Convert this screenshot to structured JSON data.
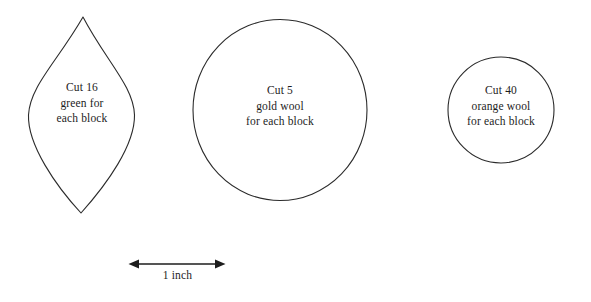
{
  "page": {
    "background_color": "#ffffff",
    "ink_color": "#1d1d1d",
    "stroke_color": "#2b2b2b"
  },
  "shapes": [
    {
      "name": "leaf",
      "icon": "leaf-outline-shape",
      "lines": [
        "Cut 16",
        "green for",
        "each block"
      ],
      "quantity": "16",
      "material": "green"
    },
    {
      "name": "large-circle",
      "icon": "circle-outline-shape",
      "lines": [
        "Cut 5",
        "gold wool",
        "for each block"
      ],
      "quantity": "5",
      "material": "gold wool"
    },
    {
      "name": "small-circle",
      "icon": "circle-outline-shape",
      "lines": [
        "Cut 40",
        "orange wool",
        "for each block"
      ],
      "quantity": "40",
      "material": "orange wool"
    }
  ],
  "scale_bar": {
    "label": "1 inch",
    "icon": "double-headed-arrow-icon"
  }
}
